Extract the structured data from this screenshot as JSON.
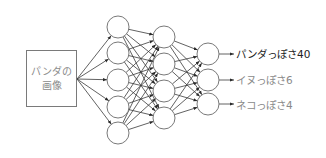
{
  "diagram": {
    "type": "neural-network",
    "input": {
      "line1": "パンダの",
      "line2": "画像"
    },
    "layers": [
      {
        "name": "hidden-layer-1",
        "nodes": 5
      },
      {
        "name": "hidden-layer-2",
        "nodes": 4
      },
      {
        "name": "output-layer",
        "nodes": 3
      }
    ],
    "outputs": [
      {
        "label": "パンダっぽさ40",
        "color": "#222222"
      },
      {
        "label": "イヌっぽさ6",
        "color": "#8a8a8a"
      },
      {
        "label": "ネコっぽさ4",
        "color": "#8a8a8a"
      }
    ],
    "colors": {
      "line": "#3a3a3a",
      "node_stroke": "#6a6a6a",
      "box_stroke": "#7a7a7a"
    }
  }
}
